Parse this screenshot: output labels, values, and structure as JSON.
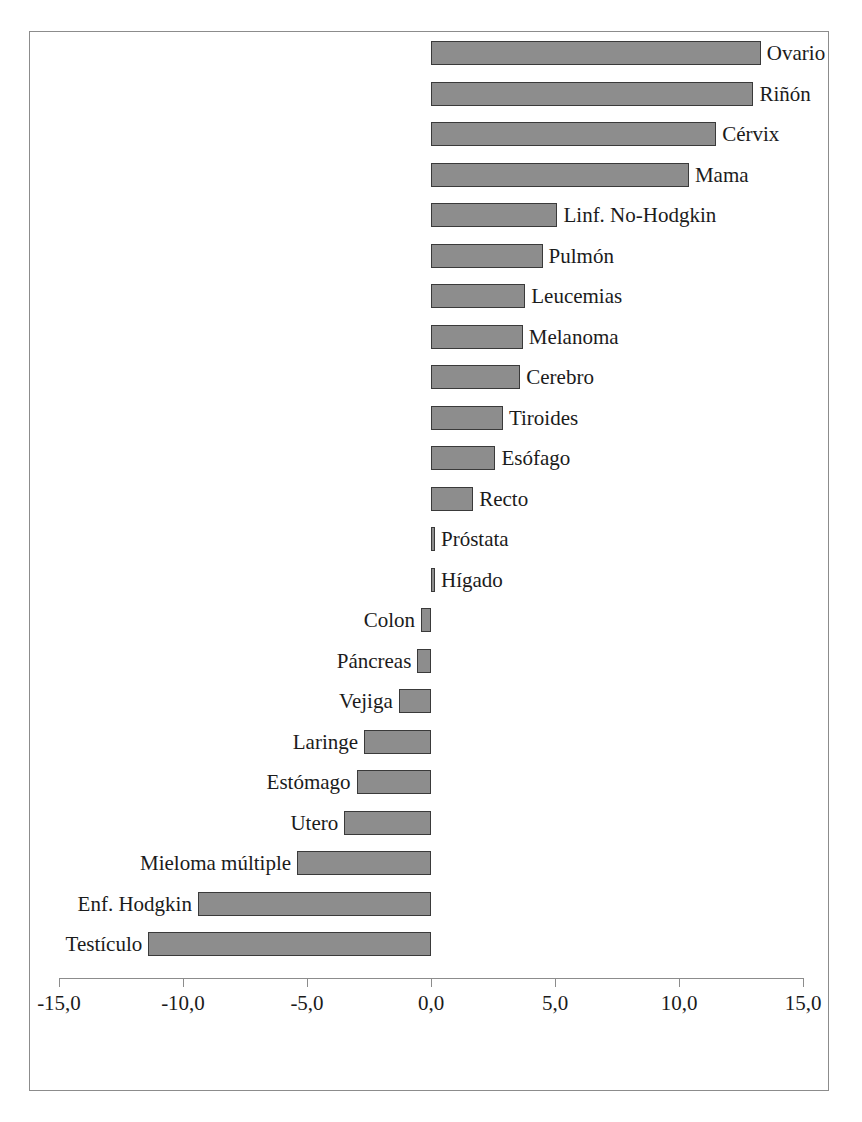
{
  "chart_data": {
    "type": "bar",
    "orientation": "horizontal",
    "title": "",
    "subtitle": "",
    "xlabel": "",
    "ylabel": "",
    "xlim": [
      -15.0,
      15.0
    ],
    "grid": false,
    "legend": "none",
    "bar_color": "#8d8d8d",
    "bar_border_color": "#3a3a3a",
    "frame_color": "#8c8c8c",
    "axis_ticks": [
      "-15,0",
      "-10,0",
      "-5,0",
      "0,0",
      "5,0",
      "10,0",
      "15,0"
    ],
    "axis_tick_values": [
      -15,
      -10,
      -5,
      0,
      5,
      10,
      15
    ],
    "categories": [
      "Ovario",
      "Riñón",
      "Cérvix",
      "Mama",
      "Linf. No-Hodgkin",
      "Pulmón",
      "Leucemias",
      "Melanoma",
      "Cerebro",
      "Tiroides",
      "Esófago",
      "Recto",
      "Próstata",
      "Hígado",
      "Colon",
      "Páncreas",
      "Vejiga",
      "Laringe",
      "Estómago",
      "Utero",
      "Mieloma múltiple",
      "Enf. Hodgkin",
      "Testículo"
    ],
    "values": [
      13.3,
      13.0,
      11.5,
      10.4,
      5.1,
      4.5,
      3.8,
      3.7,
      3.6,
      2.9,
      2.6,
      1.7,
      0.15,
      0.15,
      -0.4,
      -0.55,
      -1.3,
      -2.7,
      -3.0,
      -3.5,
      -5.4,
      -9.4,
      -11.4
    ]
  }
}
